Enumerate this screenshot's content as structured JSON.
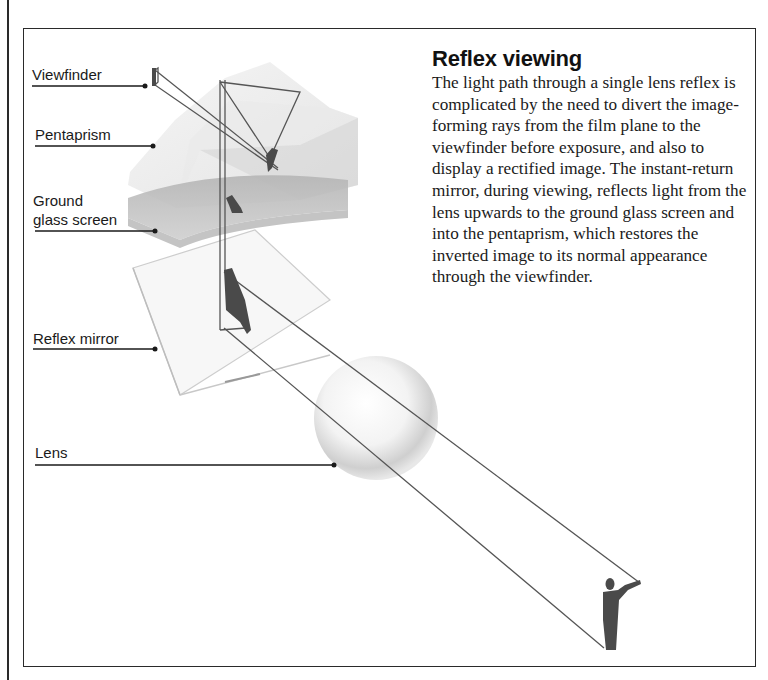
{
  "article": {
    "title": "Reflex viewing",
    "body": "The light path through a single lens reflex is complicated by the need to divert the image-forming rays from the film plane to the viewfinder before exposure, and also to display a rectified image. The instant-return mirror, during viewing, reflects light from the lens upwards to the ground glass screen and into the pentaprism, which restores the inverted image to its normal appearance through the viewfinder."
  },
  "diagram": {
    "labels": {
      "viewfinder": "Viewfinder",
      "pentaprism": "Pentaprism",
      "ground_glass_line1": "Ground",
      "ground_glass_line2": "glass screen",
      "reflex_mirror": "Reflex mirror",
      "lens": "Lens"
    },
    "colors": {
      "ray": "#555555",
      "leader": "#1a1a1a",
      "glass": "#d9d9d9",
      "screen": "#a8a8a8",
      "figure": "#4a4a4a"
    }
  }
}
